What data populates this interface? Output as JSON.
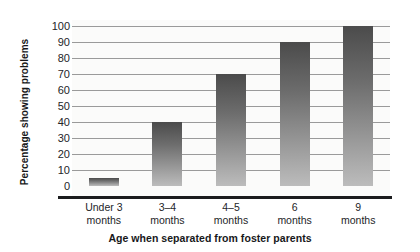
{
  "chart_data": {
    "type": "bar",
    "title": "",
    "subtitle": "",
    "xlabel": "Age when separated from foster parents",
    "ylabel": "Percentage showing problems",
    "categories": [
      "Under 3 months",
      "3–4 months",
      "4–5 months",
      "6 months",
      "9 months"
    ],
    "category_lines": [
      [
        "Under 3",
        "months"
      ],
      [
        "3–4",
        "months"
      ],
      [
        "4–5",
        "months"
      ],
      [
        "6",
        "months"
      ],
      [
        "9",
        "months"
      ]
    ],
    "values": [
      5,
      40,
      70,
      90,
      100
    ],
    "ylim": [
      0,
      100
    ],
    "yticks": [
      0,
      10,
      20,
      30,
      40,
      50,
      60,
      70,
      80,
      90,
      100
    ],
    "ytick_labels": [
      "0",
      "10",
      "20",
      "30",
      "40",
      "50",
      "60",
      "70",
      "80",
      "90",
      "100"
    ],
    "grid": true,
    "grid_axis": "y",
    "legend": false,
    "legend_position": "none",
    "annotations": [],
    "colors": {
      "bar_top": "#4b4b4b",
      "bar_bottom": "#bcbcbc",
      "gridline": "#9a9a9a",
      "axis_line": "#1b1c1e",
      "plot_background": "#fbfbfa",
      "figure_background": "#ffffff",
      "text": "#232528",
      "title_text": "#17181a"
    }
  }
}
